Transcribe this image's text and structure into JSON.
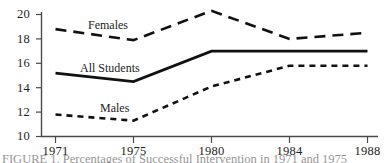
{
  "chart_data": {
    "type": "line",
    "title": "",
    "xlabel": "",
    "ylabel": "",
    "x": [
      1971,
      1975,
      1980,
      1984,
      1988
    ],
    "categories": [
      "1971",
      "1975",
      "1980",
      "1984",
      "1988"
    ],
    "xtick_labels": [
      "1971",
      "1975",
      "1980",
      "1984",
      "1988"
    ],
    "ytick_labels": [
      "10",
      "12",
      "14",
      "16",
      "18",
      "20"
    ],
    "yticks": [
      10,
      12,
      14,
      16,
      18,
      20
    ],
    "ylim": [
      10,
      20.8
    ],
    "xlim": [
      1971,
      1988
    ],
    "grid": false,
    "legend_position": "inline-labels",
    "series": [
      {
        "name": "Females",
        "label": "Females",
        "style": "dashed",
        "values": [
          18.8,
          17.9,
          20.3,
          18.0,
          18.5
        ]
      },
      {
        "name": "All Students",
        "label": "All Students",
        "style": "solid",
        "values": [
          15.2,
          14.5,
          17.0,
          17.0,
          17.0
        ]
      },
      {
        "name": "Males",
        "label": "Males",
        "style": "fine-dashed",
        "values": [
          11.8,
          11.3,
          14.1,
          15.8,
          15.8
        ]
      }
    ],
    "colors": {
      "line": "#111111",
      "axis": "#4a4a4a",
      "text": "#1d1d1d",
      "background": "#ffffff"
    }
  },
  "caption": {
    "text": "FIGURE 1.  Percentages of Successful Intervention in 1971 and 1975"
  }
}
